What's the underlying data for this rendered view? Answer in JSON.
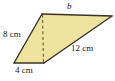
{
  "figure": {
    "kind": "geometry-diagram",
    "shape": "quadrilateral-with-altitude",
    "fill_color": "#EFE3A0",
    "stroke_color": "#3A3226",
    "dashed_color": "#6B5B3E",
    "background_color": "#FFFFFF",
    "labels": {
      "top_side": "b",
      "left_side": "8 cm",
      "bottom_side": "4 cm",
      "diagonal": "12 cm"
    },
    "vertices": {
      "top_left": [
        42,
        14
      ],
      "top_right": [
        112,
        16
      ],
      "bottom_right": [
        44,
        63
      ],
      "bottom_left": [
        14,
        63
      ],
      "altitude_foot": [
        43,
        63
      ]
    }
  }
}
